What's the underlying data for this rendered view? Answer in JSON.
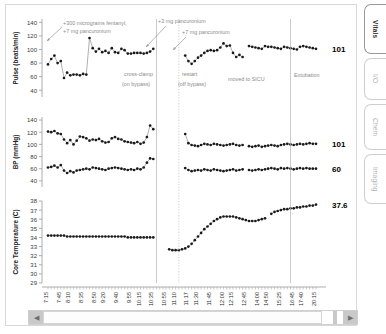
{
  "window": {
    "title": "Vitals Flowsheet"
  },
  "tabs": [
    {
      "label": "Vitals",
      "active": true
    },
    {
      "label": "I/O",
      "active": false
    },
    {
      "label": "Chem",
      "active": false
    },
    {
      "label": "Imaging",
      "active": false
    }
  ],
  "scrollbar": {
    "left_arrow": "◀",
    "right_arrow": "▶"
  },
  "annotations": {
    "fentanyl": "+300 micrograms fentanyl,",
    "fentanyl_line2": "+7 mg pancuronium",
    "panc3": "+3 mg pancuronium",
    "panc7": "+7 mg pancuronium",
    "crossclamp": "cross-clamp",
    "crossclamp_line2": "(on bypass)",
    "restart": "restart",
    "restart_line2": "(off bypass)",
    "sicu": "moved to SICU",
    "extubation": "Extubation"
  },
  "current_values": {
    "pulse": "101",
    "bp_systolic": "101",
    "bp_diastolic": "60",
    "temperature": "37.6"
  },
  "colors": {
    "marker": "#1a1a1a",
    "line": "#555555",
    "axis": "#9b9b9b",
    "annotation_text": "#8c8c8c",
    "event_line": "#b5b5b5",
    "value_text": "#000000"
  },
  "chart_data": [
    {
      "type": "line",
      "title": "Pulse",
      "ylabel": "Pulse (beats/min)",
      "xlabel": "",
      "ylim": [
        30,
        145
      ],
      "yticks": [
        40,
        60,
        80,
        100,
        120,
        140
      ],
      "grid": false,
      "legend": null,
      "x": [
        0,
        1,
        2,
        3,
        4,
        5,
        6,
        7,
        8,
        9,
        10,
        11,
        12,
        13,
        14,
        15,
        16,
        17,
        18,
        19,
        20,
        21,
        22,
        23,
        24,
        25,
        26,
        27,
        28,
        29,
        30,
        31,
        32,
        33,
        34,
        35,
        36,
        37,
        38,
        39,
        40,
        41,
        42,
        43,
        44,
        45,
        46,
        47,
        48,
        49,
        50,
        51,
        52,
        53,
        54,
        55,
        56,
        57,
        58,
        59,
        60,
        61,
        62,
        63,
        64,
        65,
        66,
        67,
        68,
        69,
        70,
        71,
        72,
        73,
        74,
        75,
        76,
        77,
        78,
        79,
        80,
        81,
        82,
        83,
        84
      ],
      "values": [
        78,
        86,
        91,
        80,
        83,
        58,
        66,
        62,
        63,
        63,
        62,
        64,
        63,
        117,
        102,
        97,
        101,
        96,
        98,
        95,
        102,
        96,
        95,
        101,
        99,
        94,
        94,
        95,
        95,
        95,
        94,
        95,
        97,
        101,
        null,
        null,
        null,
        null,
        null,
        null,
        null,
        null,
        null,
        91,
        83,
        79,
        83,
        88,
        91,
        95,
        98,
        99,
        98,
        99,
        103,
        109,
        105,
        106,
        95,
        89,
        92,
        89,
        null,
        105,
        104,
        103,
        102,
        101,
        105,
        104,
        104,
        103,
        102,
        101,
        104,
        103,
        102,
        101,
        100,
        104,
        105,
        104,
        103,
        102,
        101
      ],
      "end_value_label": "101"
    },
    {
      "type": "line",
      "title": "Blood Pressure",
      "ylabel": "BP (mmHg)",
      "xlabel": "",
      "ylim": [
        30,
        145
      ],
      "yticks": [
        40,
        60,
        80,
        100,
        120,
        140
      ],
      "grid": false,
      "series": [
        {
          "name": "Systolic",
          "values": [
            121,
            120,
            122,
            118,
            117,
            108,
            102,
            107,
            100,
            106,
            113,
            112,
            110,
            106,
            108,
            107,
            109,
            105,
            103,
            104,
            110,
            112,
            109,
            108,
            105,
            104,
            103,
            102,
            104,
            101,
            103,
            112,
            131,
            125,
            null,
            null,
            null,
            null,
            null,
            null,
            null,
            null,
            null,
            117,
            102,
            99,
            98,
            97,
            99,
            101,
            100,
            99,
            101,
            100,
            99,
            98,
            99,
            100,
            101,
            99,
            98,
            99,
            null,
            97,
            96,
            97,
            98,
            96,
            97,
            98,
            99,
            98,
            97,
            99,
            100,
            101,
            100,
            99,
            100,
            101,
            100,
            101,
            102,
            101,
            101
          ],
          "end_value_label": "101"
        },
        {
          "name": "Diastolic",
          "values": [
            62,
            63,
            65,
            62,
            66,
            57,
            53,
            56,
            54,
            57,
            58,
            59,
            60,
            59,
            62,
            61,
            60,
            59,
            58,
            60,
            61,
            62,
            61,
            60,
            59,
            58,
            59,
            58,
            60,
            59,
            62,
            70,
            77,
            76,
            null,
            null,
            null,
            null,
            null,
            null,
            null,
            null,
            null,
            61,
            58,
            56,
            57,
            58,
            57,
            59,
            58,
            57,
            59,
            58,
            57,
            56,
            57,
            58,
            59,
            57,
            58,
            59,
            null,
            58,
            57,
            58,
            59,
            58,
            59,
            60,
            61,
            60,
            59,
            61,
            60,
            61,
            60,
            59,
            60,
            61,
            60,
            61,
            60,
            60,
            60
          ],
          "end_value_label": "60"
        }
      ]
    },
    {
      "type": "line",
      "title": "Core Temperature",
      "ylabel": "Core Temperature (C)",
      "xlabel": "",
      "ylim": [
        29,
        38
      ],
      "yticks": [
        29,
        30,
        31,
        32,
        33,
        34,
        35,
        36,
        37,
        38
      ],
      "grid": false,
      "values": [
        34.2,
        34.2,
        34.2,
        34.2,
        34.2,
        34.2,
        34.1,
        34.1,
        34.1,
        34.1,
        34.1,
        34.1,
        34.1,
        34.1,
        34.1,
        34.1,
        34.1,
        34.1,
        34.1,
        34.1,
        34.1,
        34.1,
        34.1,
        34.1,
        34.1,
        34.0,
        34.0,
        34.0,
        34.0,
        34.0,
        34.0,
        34.0,
        34.0,
        34.0,
        null,
        null,
        null,
        null,
        32.7,
        32.6,
        32.6,
        32.6,
        32.7,
        32.8,
        33.0,
        33.3,
        33.7,
        34.1,
        34.5,
        34.9,
        35.2,
        35.5,
        35.8,
        36.0,
        36.2,
        36.3,
        36.3,
        36.3,
        36.3,
        36.2,
        36.1,
        36.0,
        35.9,
        35.8,
        35.8,
        35.8,
        35.9,
        36.0,
        36.1,
        null,
        36.6,
        36.8,
        36.9,
        37.0,
        37.1,
        37.1,
        37.2,
        37.2,
        37.3,
        37.3,
        37.4,
        37.4,
        37.5,
        37.5,
        37.6
      ],
      "end_value_label": "37.6"
    }
  ],
  "xaxis": {
    "ticklabels": [
      "7:15",
      "7:45",
      "8:10",
      "8:35",
      "8:50",
      "9:20",
      "9:40",
      "9:55",
      "10:15",
      "10:35",
      "10:55",
      "11:10",
      "11:17",
      "11:30",
      "11:45",
      "12:00",
      "12:15",
      "12:45",
      "14:00",
      "14:50",
      "15:25",
      "16:45",
      "17:40",
      "20:15"
    ]
  }
}
